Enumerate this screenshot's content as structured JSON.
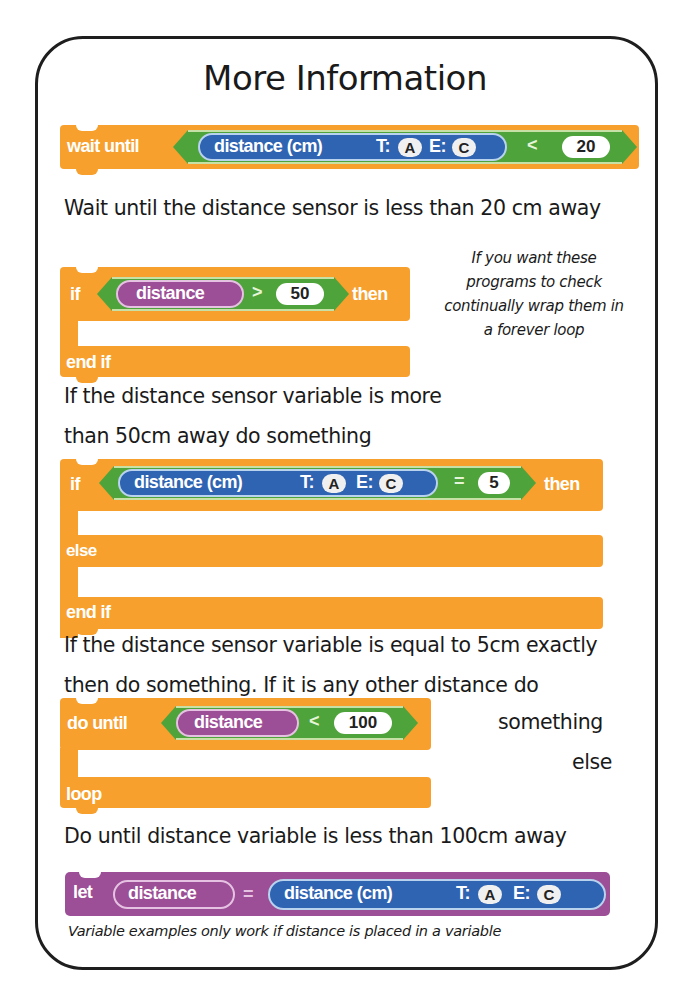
{
  "title": "More Information",
  "colors": {
    "control_orange": "#f7a02d",
    "operator_green": "#4fa33b",
    "sensor_blue": "#2f64b2",
    "variable_purple": "#9c4f96",
    "border": "#1e1e1e"
  },
  "blocks": {
    "wait_until": {
      "keyword": "wait until",
      "sensor": {
        "label": "distance (cm)",
        "t_label": "T:",
        "t_port": "A",
        "e_label": "E:",
        "e_port": "C"
      },
      "operator": "<",
      "value": "20",
      "caption": "Wait until the distance sensor is less than 20 cm away"
    },
    "if_var": {
      "keyword_if": "if",
      "variable": "distance",
      "operator": ">",
      "value": "50",
      "keyword_then": "then",
      "keyword_end": "end if",
      "caption_lines": [
        "If the distance sensor variable is more",
        "than 50cm away do something"
      ]
    },
    "side_note": {
      "lines": [
        "If you want these",
        "programs to check",
        "continually wrap them in",
        "a forever loop"
      ]
    },
    "if_else": {
      "keyword_if": "if",
      "sensor": {
        "label": "distance (cm)",
        "t_label": "T:",
        "t_port": "A",
        "e_label": "E:",
        "e_port": "C"
      },
      "operator": "=",
      "value": "5",
      "keyword_then": "then",
      "keyword_else": "else",
      "keyword_end": "end if",
      "caption_lines": [
        "If the distance sensor variable is equal to 5cm exactly",
        "then do something. If it is any other distance do",
        "something",
        "else"
      ]
    },
    "do_until": {
      "keyword": "do until",
      "variable": "distance",
      "operator": "<",
      "value": "100",
      "keyword_end": "loop",
      "caption": "Do until distance variable is less than 100cm away"
    },
    "let_block": {
      "keyword": "let",
      "variable": "distance",
      "operator": "=",
      "sensor": {
        "label": "distance (cm)",
        "t_label": "T:",
        "t_port": "A",
        "e_label": "E:",
        "e_port": "C"
      },
      "note": "Variable examples only work if distance is placed in a variable"
    }
  }
}
